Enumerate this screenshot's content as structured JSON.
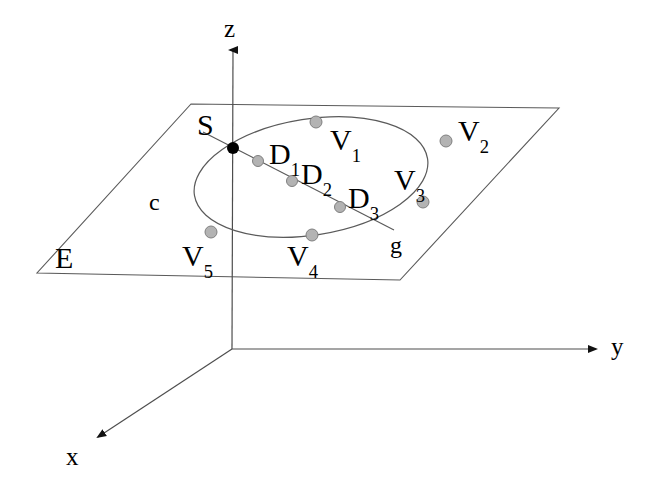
{
  "figure": {
    "background_color": "#ffffff",
    "line_color": "#5a5a5a",
    "axis_color": "#4d4d4d",
    "text_color": "#000000",
    "vertex_fill": "#b3b3b3",
    "vertex_stroke": "#808080",
    "apex_fill": "#000000"
  },
  "axes": [
    {
      "key": "z",
      "label": "z",
      "label_x": 224,
      "label_y": 16,
      "arrow_tip_x": 233,
      "arrow_tip_y": 50
    },
    {
      "key": "y",
      "label": "y",
      "label_x": 611,
      "label_y": 334,
      "arrow_tip_x": 596,
      "arrow_tip_y": 349
    },
    {
      "key": "x",
      "label": "x",
      "label_x": 66,
      "label_y": 444,
      "arrow_tip_x": 98,
      "arrow_tip_y": 437
    }
  ],
  "origin": {
    "x": 232,
    "y": 349
  },
  "plane": {
    "label": "E",
    "label_x": 55,
    "label_y": 243,
    "corners": [
      {
        "x": 191,
        "y": 104
      },
      {
        "x": 559,
        "y": 108
      },
      {
        "x": 400,
        "y": 280
      },
      {
        "x": 37,
        "y": 273
      }
    ]
  },
  "conic": {
    "label": "c",
    "label_x": 149,
    "label_y": 190,
    "center_x": 311,
    "center_y": 177,
    "radius_x": 118,
    "radius_y": 58,
    "rotation_deg": -9
  },
  "line_g": {
    "label": "g",
    "label_x": 390,
    "label_y": 233,
    "start_x": 203,
    "start_y": 132,
    "end_x": 394,
    "end_y": 230
  },
  "apex": {
    "label": "S",
    "label_x": 197,
    "label_y": 110,
    "x": 233,
    "y": 148,
    "radius": 6
  },
  "points": [
    {
      "name": "V1",
      "base": "V",
      "sub": "1",
      "x": 316,
      "y": 122,
      "label_x": 330,
      "label_y": 125,
      "radius": 6
    },
    {
      "name": "V2",
      "base": "V",
      "sub": "2",
      "x": 446,
      "y": 141,
      "label_x": 458,
      "label_y": 116,
      "radius": 6
    },
    {
      "name": "V3",
      "base": "V",
      "sub": "3",
      "x": 423,
      "y": 202,
      "label_x": 394,
      "label_y": 165,
      "radius": 6
    },
    {
      "name": "V4",
      "base": "V",
      "sub": "4",
      "x": 312,
      "y": 235,
      "label_x": 287,
      "label_y": 241,
      "radius": 6
    },
    {
      "name": "V5",
      "base": "V",
      "sub": "5",
      "x": 211,
      "y": 232,
      "label_x": 182,
      "label_y": 241,
      "radius": 6
    },
    {
      "name": "D1",
      "base": "D",
      "sub": "1",
      "x": 258,
      "y": 161,
      "label_x": 269,
      "label_y": 139,
      "radius": 5.5
    },
    {
      "name": "D2",
      "base": "D",
      "sub": "2",
      "x": 292,
      "y": 181,
      "label_x": 301,
      "label_y": 159,
      "radius": 5.5
    },
    {
      "name": "D3",
      "base": "D",
      "sub": "3",
      "x": 340,
      "y": 207,
      "label_x": 348,
      "label_y": 183,
      "radius": 5.5
    }
  ]
}
